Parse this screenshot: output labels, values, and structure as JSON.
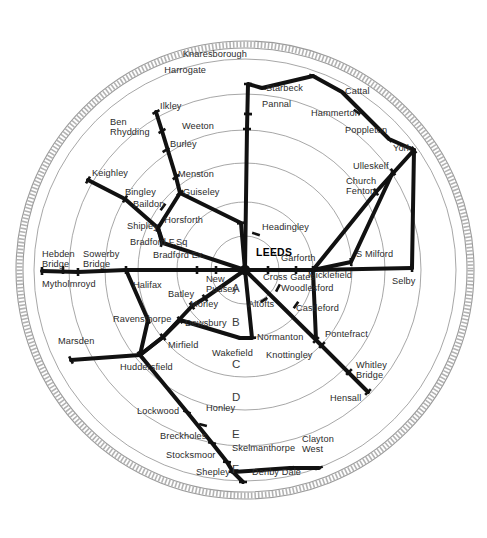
{
  "diagram": {
    "hub": {
      "label": "LEEDS",
      "x": 245,
      "y": 270
    },
    "colors": {
      "track": "#111111",
      "ring": "#8a8a8a",
      "outer_ring": "#9b9b9b",
      "label": "#2b2b2b"
    },
    "ring_labels": [
      {
        "text": "A",
        "x": 232,
        "y": 290
      },
      {
        "text": "B",
        "x": 232,
        "y": 324
      },
      {
        "text": "C",
        "x": 232,
        "y": 366
      },
      {
        "text": "D",
        "x": 232,
        "y": 399
      },
      {
        "text": "E",
        "x": 232,
        "y": 436
      },
      {
        "text": "F",
        "x": 232,
        "y": 471
      }
    ],
    "rings": [
      {
        "name": "ring-A",
        "r": 34
      },
      {
        "name": "ring-B",
        "r": 68
      },
      {
        "name": "ring-C",
        "r": 107
      },
      {
        "name": "ring-D",
        "r": 140
      },
      {
        "name": "ring-E",
        "r": 176
      },
      {
        "name": "ring-F",
        "r": 211
      }
    ],
    "outer_band": {
      "r_inner": 222,
      "r_outer": 229
    },
    "stations": [
      {
        "name": "knaresborough",
        "label": "Knaresborough",
        "lx": 247,
        "ly": 58,
        "anchor": "end",
        "nx": 313,
        "ny": 76
      },
      {
        "name": "harrogate",
        "label": "Harrogate",
        "lx": 206,
        "ly": 74,
        "anchor": "end",
        "nx": 248,
        "ny": 84
      },
      {
        "name": "starbeck",
        "label": "Starbeck",
        "lx": 266,
        "ly": 92,
        "anchor": "start",
        "nx": 262,
        "ny": 88
      },
      {
        "name": "pannal",
        "label": "Pannal",
        "lx": 262,
        "ly": 108,
        "anchor": "start",
        "nx": 248,
        "ny": 114
      },
      {
        "name": "weeton",
        "label": "Weeton",
        "lx": 214,
        "ly": 130,
        "anchor": "end",
        "nx": 247,
        "ny": 129
      },
      {
        "name": "cattal",
        "label": "Cattal",
        "lx": 345,
        "ly": 95,
        "anchor": "start",
        "nx": 342,
        "ny": 92
      },
      {
        "name": "hammerton",
        "label": "Hammerton",
        "lx": 311,
        "ly": 117,
        "anchor": "start",
        "nx": 357,
        "ny": 112
      },
      {
        "name": "poppleton",
        "label": "Poppleton",
        "lx": 345,
        "ly": 134,
        "anchor": "start",
        "nx": 389,
        "ny": 139
      },
      {
        "name": "york",
        "label": "York",
        "lx": 393,
        "ly": 152,
        "anchor": "start",
        "nx": 414,
        "ny": 150
      },
      {
        "name": "ulleskelf",
        "label": "Ulleskelf",
        "lx": 353,
        "ly": 170,
        "anchor": "start",
        "nx": 393,
        "ny": 172
      },
      {
        "name": "church-fenton",
        "label": "Church\nFenton",
        "lx": 346,
        "ly": 185,
        "anchor": "start",
        "nx": 376,
        "ny": 192
      },
      {
        "name": "s-milford",
        "label": "S Milford",
        "lx": 356,
        "ly": 258,
        "anchor": "start",
        "nx": 351,
        "ny": 262
      },
      {
        "name": "selby",
        "label": "Selby",
        "lx": 392,
        "ly": 285,
        "anchor": "start",
        "nx": 412,
        "ny": 268
      },
      {
        "name": "micklefield",
        "label": "Micklefield",
        "lx": 308,
        "ly": 279,
        "anchor": "start",
        "nx": 313,
        "ny": 270
      },
      {
        "name": "garforth",
        "label": "Garforth",
        "lx": 281,
        "ly": 262,
        "anchor": "start",
        "nx": 296,
        "ny": 270
      },
      {
        "name": "cross-gates",
        "label": "Cross Gates",
        "lx": 263,
        "ly": 281,
        "anchor": "start",
        "nx": 268,
        "ny": 270
      },
      {
        "name": "headingley",
        "label": "Headingley",
        "lx": 262,
        "ly": 231,
        "anchor": "start",
        "nx": 256,
        "ny": 234
      },
      {
        "name": "horsforth",
        "label": "Horsforth",
        "lx": 203,
        "ly": 224,
        "anchor": "end",
        "nx": 241,
        "ny": 223
      },
      {
        "name": "woodlesford",
        "label": "Woodlesford",
        "lx": 281,
        "ly": 292,
        "anchor": "start",
        "nx": 278,
        "ny": 288
      },
      {
        "name": "castleford",
        "label": "Castleford",
        "lx": 296,
        "ly": 312,
        "anchor": "start",
        "nx": 296,
        "ny": 305
      },
      {
        "name": "pontefract",
        "label": "Pontefract",
        "lx": 325,
        "ly": 338,
        "anchor": "start",
        "nx": 316,
        "ny": 340
      },
      {
        "name": "knottingley",
        "label": "Knottingley",
        "lx": 266,
        "ly": 359,
        "anchor": "start",
        "nx": 322,
        "ny": 345
      },
      {
        "name": "whitley-bridge",
        "label": "Whitley\nBridge",
        "lx": 356,
        "ly": 369,
        "anchor": "start",
        "nx": 349,
        "ny": 372
      },
      {
        "name": "hensall",
        "label": "Hensall",
        "lx": 330,
        "ly": 402,
        "anchor": "start",
        "nx": 368,
        "ny": 392
      },
      {
        "name": "normanton",
        "label": "Normanton",
        "lx": 257,
        "ly": 341,
        "anchor": "start",
        "nx": 252,
        "ny": 338
      },
      {
        "name": "altofts",
        "label": "Altofts",
        "lx": 248,
        "ly": 308,
        "anchor": "start",
        "nx": 264,
        "ny": 300
      },
      {
        "name": "wakefield",
        "label": "Wakefield",
        "lx": 212,
        "ly": 357,
        "anchor": "start",
        "nx": 240,
        "ly2": 0,
        "ny": 338
      },
      {
        "name": "new-pudsey",
        "label": "New\nPudsey",
        "lx": 206,
        "ly": 283,
        "anchor": "start",
        "nx": 216,
        "ny": 270
      },
      {
        "name": "morley",
        "label": "Morley",
        "lx": 190,
        "ly": 308,
        "anchor": "start",
        "nx": 205,
        "ny": 298
      },
      {
        "name": "batley",
        "label": "Batley",
        "lx": 168,
        "ly": 298,
        "anchor": "start",
        "nx": 192,
        "ny": 306
      },
      {
        "name": "dewsbury",
        "label": "Dewsbury",
        "lx": 185,
        "ly": 327,
        "anchor": "start",
        "nx": 180,
        "ly3": 0,
        "ny": 320
      },
      {
        "name": "mirfield",
        "label": "Mirfield",
        "lx": 168,
        "ly": 349,
        "anchor": "start",
        "nx": 163,
        "ny": 337
      },
      {
        "name": "ravensthorpe",
        "label": "Ravensthorpe",
        "lx": 113,
        "ly": 323,
        "anchor": "start",
        "nx": 148,
        "ny": 320
      },
      {
        "name": "halifax",
        "label": "Halifax",
        "lx": 133,
        "ly": 289,
        "anchor": "start",
        "nx": 126,
        "ny": 270
      },
      {
        "name": "sowerby-bridge",
        "label": "Sowerby\nBridge",
        "lx": 83,
        "ly": 258,
        "anchor": "start",
        "nx": 63,
        "ny": 270
      },
      {
        "name": "hebden-bridge",
        "label": "Hebden\nBridge",
        "lx": 42,
        "ly": 258,
        "anchor": "start",
        "nx": 42,
        "ny": 271
      },
      {
        "name": "mytholmroyd",
        "label": "Mytholmroyd",
        "lx": 42,
        "ly": 288,
        "anchor": "start",
        "nx": 78,
        "ny": 272
      },
      {
        "name": "marsden",
        "label": "Marsden",
        "lx": 58,
        "ly": 345,
        "anchor": "start",
        "nx": 71,
        "ny": 360
      },
      {
        "name": "huddersfield",
        "label": "Huddersfield",
        "lx": 120,
        "ly": 371,
        "anchor": "start",
        "nx": 140,
        "ny": 355
      },
      {
        "name": "lockwood",
        "label": "Lockwood",
        "lx": 137,
        "ly": 415,
        "anchor": "start",
        "nx": 187,
        "ly4": 0,
        "ny": 412
      },
      {
        "name": "honley",
        "label": "Honley",
        "lx": 206,
        "ly": 412,
        "anchor": "start",
        "nx": 203,
        "ny": 425
      },
      {
        "name": "brockholes",
        "label": "Breckholes",
        "lx": 160,
        "ly": 440,
        "anchor": "start",
        "nx": 212,
        "ny": 443
      },
      {
        "name": "stocksmoor",
        "label": "Stocksmoor",
        "lx": 166,
        "ly": 459,
        "anchor": "start",
        "nx": 227,
        "ny": 462
      },
      {
        "name": "shepley",
        "label": "Shepley",
        "lx": 196,
        "ly": 476,
        "anchor": "start",
        "nx": 233,
        "ny": 472
      },
      {
        "name": "denby-dale",
        "label": "Denby Dale",
        "lx": 252,
        "ly": 476,
        "anchor": "start",
        "nx": 243,
        "ny": 482
      },
      {
        "name": "skelmanthorpe",
        "label": "Skelmanthorpe",
        "lx": 232,
        "ly": 452,
        "anchor": "start",
        "nx": 290,
        "ny": 468
      },
      {
        "name": "clayton-west",
        "label": "Clayton\nWest",
        "lx": 302,
        "ly": 443,
        "anchor": "start",
        "nx": 319,
        "ny": 468
      },
      {
        "name": "ilkley",
        "label": "Ilkley",
        "lx": 160,
        "ly": 110,
        "anchor": "start",
        "nx": 156,
        "ny": 112
      },
      {
        "name": "ben-rhydding",
        "label": "Ben\nRhydding",
        "lx": 110,
        "ly": 126,
        "anchor": "start",
        "nx": 162,
        "ny": 131
      },
      {
        "name": "burley",
        "label": "Burley",
        "lx": 170,
        "ly": 148,
        "anchor": "start",
        "nx": 166,
        "ny": 150
      },
      {
        "name": "menston",
        "label": "Menston",
        "lx": 178,
        "ly": 178,
        "anchor": "start",
        "nx": 176,
        "ny": 177
      },
      {
        "name": "guiseley",
        "label": "Guiseley",
        "lx": 183,
        "ly": 196,
        "anchor": "start",
        "nx": 180,
        "ny": 193
      },
      {
        "name": "keighley",
        "label": "Keighley",
        "lx": 92,
        "ly": 177,
        "anchor": "start",
        "nx": 88,
        "ny": 180
      },
      {
        "name": "bingley",
        "label": "Bingley",
        "lx": 125,
        "ly": 196,
        "anchor": "start",
        "nx": 125,
        "ny": 199
      },
      {
        "name": "baildon",
        "label": "Baildon",
        "lx": 133,
        "ly": 208,
        "anchor": "start",
        "nx": 163,
        "ny": 207
      },
      {
        "name": "shipley",
        "label": "Shipley",
        "lx": 127,
        "ly": 230,
        "anchor": "start",
        "nx": 158,
        "ny": 228
      },
      {
        "name": "bradford-fsq",
        "label": "Bradford F.Sq",
        "lx": 130,
        "ly": 246,
        "anchor": "start",
        "nx": 162,
        "ny": 243
      },
      {
        "name": "bradford-ex",
        "label": "Bradford Ex.",
        "lx": 153,
        "ly": 259,
        "anchor": "start",
        "nx": 197,
        "ny": 270
      }
    ],
    "lines": [
      {
        "name": "leeds-harrogate-knaresborough",
        "points": "245,270 247,129 248,84 262,88 313,76"
      },
      {
        "name": "knaresborough-york",
        "points": "313,76 342,92 389,139 414,150"
      },
      {
        "name": "york-selby",
        "points": "414,150 412,268"
      },
      {
        "name": "york-church-fenton-micklefield",
        "points": "414,150 376,192 313,270"
      },
      {
        "name": "york-leeds-cross-gates",
        "points": "393,172 351,262 313,270 245,270"
      },
      {
        "name": "selby-micklefield",
        "points": "412,268 313,270"
      },
      {
        "name": "leeds-pontefract-hensall",
        "points": "245,270 316,340 368,392"
      },
      {
        "name": "micklefield-pontefract",
        "points": "313,270 316,340"
      },
      {
        "name": "leeds-normanton-wakefield",
        "points": "245,270 252,338 240,338"
      },
      {
        "name": "wakefield-dewsbury-mirfield",
        "points": "240,338 180,320 163,337 140,355"
      },
      {
        "name": "leeds-new-pudsey-bradford",
        "points": "245,270 216,270 197,270 126,270 78,272 42,271"
      },
      {
        "name": "leeds-morley-huddersfield",
        "points": "245,270 205,298 192,306 163,337 140,355"
      },
      {
        "name": "halifax-ravensthorpe-huddersfield",
        "points": "126,270 148,320 140,355"
      },
      {
        "name": "huddersfield-marsden",
        "points": "140,355 71,360"
      },
      {
        "name": "huddersfield-shepley-denby",
        "points": "140,355 187,412 212,443 227,462 233,472 243,482"
      },
      {
        "name": "shepley-clayton-west",
        "points": "233,472 290,468 319,468"
      },
      {
        "name": "leeds-horsforth-ilkley",
        "points": "245,270 241,223 180,193 176,177 162,131 156,112"
      },
      {
        "name": "leeds-shipley-keighley",
        "points": "245,270 163,243 158,228 125,199 88,180"
      },
      {
        "name": "shipley-guiseley",
        "points": "158,228 180,193"
      },
      {
        "name": "shipley-bradford",
        "points": "158,228 162,243"
      }
    ]
  }
}
